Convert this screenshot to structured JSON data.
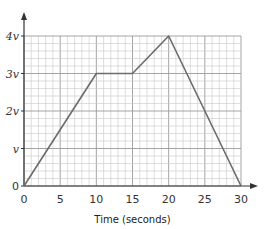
{
  "chart_data": {
    "type": "line",
    "title": "",
    "xlabel": "Time (seconds)",
    "ylabel": "",
    "x": [
      0,
      10,
      15,
      20,
      30
    ],
    "series": [
      {
        "name": "velocity",
        "values": [
          0,
          3,
          3,
          4,
          0
        ],
        "unit": "v"
      }
    ],
    "x_ticks": [
      "0",
      "5",
      "10",
      "15",
      "20",
      "25",
      "30"
    ],
    "y_ticks": [
      "0",
      "v",
      "2v",
      "3v",
      "4v"
    ],
    "xlim": [
      0,
      30
    ],
    "ylim": [
      0,
      4
    ],
    "grid": true,
    "legend": "none"
  },
  "colors": {
    "line": "#6b6b6b",
    "grid_major": "#9a9a9a",
    "grid_minor": "#c8c8c8",
    "axis": "#333333"
  }
}
